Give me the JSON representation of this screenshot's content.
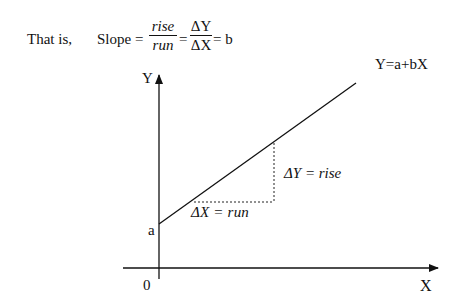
{
  "header": {
    "intro": "That is,",
    "slope_label": "Slope =",
    "frac1_num": "rise",
    "frac1_den": "run",
    "eq1": "=",
    "frac2_num": "ΔY",
    "frac2_den": "ΔX",
    "eq2": "= b"
  },
  "diagram": {
    "y_axis_label": "Y",
    "x_axis_label": "X",
    "origin_label": "0",
    "intercept_label": "a",
    "line_equation": "Y=a+bX",
    "rise_label": "ΔY = rise",
    "run_label": "ΔX = run"
  }
}
